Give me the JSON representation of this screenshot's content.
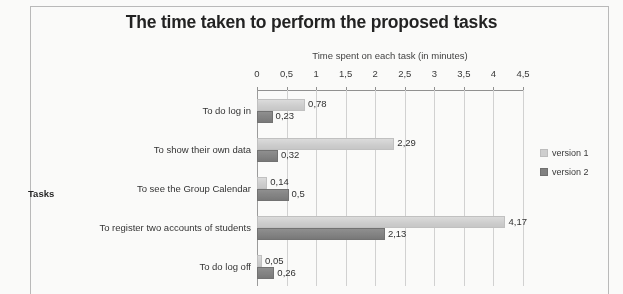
{
  "chart_data": {
    "type": "bar",
    "orientation": "horizontal",
    "title": "The time taken to perform the proposed tasks",
    "xlabel": "Time spent on each task (in minutes)",
    "ylabel": "Tasks",
    "xlim": [
      0,
      4.5
    ],
    "grid": true,
    "legend_position": "right",
    "decimal_separator": ",",
    "tick_labels": [
      "0",
      "0,5",
      "1",
      "1,5",
      "2",
      "2,5",
      "3",
      "3,5",
      "4",
      "4,5"
    ],
    "tick_values": [
      0,
      0.5,
      1,
      1.5,
      2,
      2.5,
      3,
      3.5,
      4,
      4.5
    ],
    "categories": [
      "To do log in",
      "To show their own data",
      "To see the Group Calendar",
      "To register two accounts of students",
      "To do log off"
    ],
    "series": [
      {
        "name": "version 1",
        "color": "#cfcfcf",
        "values": [
          0.78,
          2.29,
          0.14,
          4.17,
          0.05
        ],
        "labels": [
          "0,78",
          "2,29",
          "0,14",
          "4,17",
          "0,05"
        ]
      },
      {
        "name": "version 2",
        "color": "#7e7e7e",
        "values": [
          0.23,
          0.32,
          0.5,
          2.13,
          0.26
        ],
        "labels": [
          "0,23",
          "0,32",
          "0,5",
          "2,13",
          "0,26"
        ]
      }
    ]
  }
}
